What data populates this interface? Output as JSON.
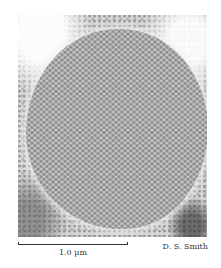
{
  "figure": {
    "type": "electron micrograph",
    "scale_bar": {
      "label": "1.0 μm"
    },
    "credit": "D. S. Smith"
  },
  "colors": {
    "background": "#ffffff",
    "lattice_dot": "#8d8d8d",
    "lattice_base": "#c9c9c9",
    "text": "#333333"
  }
}
